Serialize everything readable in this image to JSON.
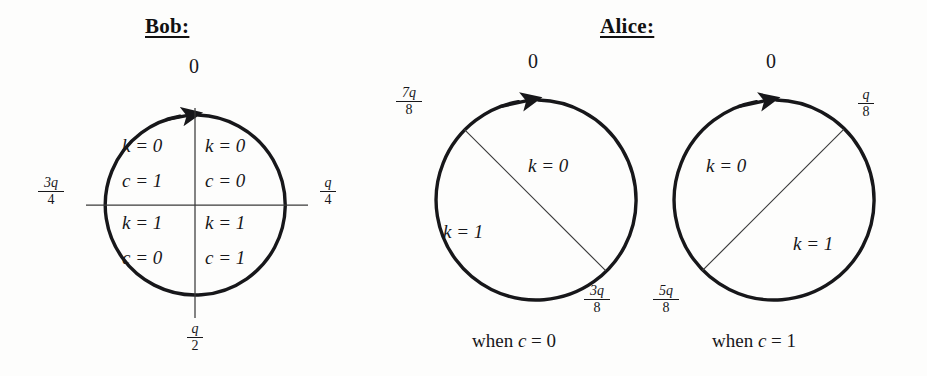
{
  "headings": {
    "bob": "Bob:",
    "alice": "Alice:"
  },
  "bob_circle": {
    "name": "bob-quadrant-circle",
    "top_label": "0",
    "right_label": {
      "numerator": "q",
      "denominator": "4"
    },
    "bottom_label": {
      "numerator": "q",
      "denominator": "2"
    },
    "left_label": {
      "numerator": "3q",
      "denominator": "4"
    },
    "quadrants": [
      {
        "position": "top-left",
        "k": "k = 0",
        "c": "c = 1"
      },
      {
        "position": "top-right",
        "k": "k = 0",
        "c": "c = 0"
      },
      {
        "position": "bottom-left",
        "k": "k = 1",
        "c": "c = 0"
      },
      {
        "position": "bottom-right",
        "k": "k = 1",
        "c": "c = 1"
      }
    ]
  },
  "alice_circles": [
    {
      "name": "alice-circle-c0",
      "caption_prefix": "when ",
      "caption_var": "c",
      "caption_suffix": " = 0",
      "top_label": "0",
      "chord_start_label": {
        "numerator": "7q",
        "denominator": "8"
      },
      "chord_end_label": {
        "numerator": "3q",
        "denominator": "8"
      },
      "regions": [
        {
          "position": "upper-right",
          "k": "k = 0"
        },
        {
          "position": "lower-left",
          "k": "k = 1"
        }
      ]
    },
    {
      "name": "alice-circle-c1",
      "caption_prefix": "when ",
      "caption_var": "c",
      "caption_suffix": " = 1",
      "top_label": "0",
      "chord_start_label": {
        "numerator": "q",
        "denominator": "8"
      },
      "chord_end_label": {
        "numerator": "5q",
        "denominator": "8"
      },
      "regions": [
        {
          "position": "upper-left",
          "k": "k = 0"
        },
        {
          "position": "lower-right",
          "k": "k = 1"
        }
      ]
    }
  ],
  "colors": {
    "ink": "#17171a",
    "background": "#fdfdfc",
    "thin_line": "#3a3a3a"
  }
}
